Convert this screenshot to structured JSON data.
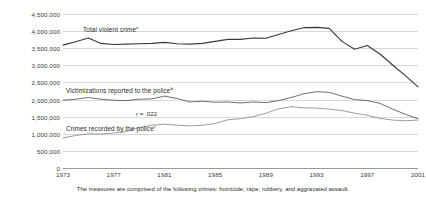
{
  "chart_data": {
    "type": "line",
    "title": "",
    "xlabel": "",
    "ylabel": "",
    "xlim": [
      1973,
      2001
    ],
    "ylim": [
      0,
      4500000
    ],
    "grid": true,
    "legend": "inline-labels",
    "y_ticks": [
      "0",
      "500,000",
      "1,000,000",
      "1,500,000",
      "2,000,000",
      "2,500,000",
      "3,000,000",
      "3,500,000",
      "4,000,000",
      "4,500,000"
    ],
    "y_tick_values": [
      0,
      500000,
      1000000,
      1500000,
      2000000,
      2500000,
      3000000,
      3500000,
      4000000,
      4500000
    ],
    "x_ticks": [
      "1973",
      "1977",
      "1981",
      "1985",
      "1989",
      "1993",
      "1997",
      "2001"
    ],
    "x_tick_values": [
      1973,
      1977,
      1981,
      1985,
      1989,
      1993,
      1997,
      2001
    ],
    "x": [
      1973,
      1974,
      1975,
      1976,
      1977,
      1978,
      1979,
      1980,
      1981,
      1982,
      1983,
      1984,
      1985,
      1986,
      1987,
      1988,
      1989,
      1990,
      1991,
      1992,
      1993,
      1994,
      1995,
      1996,
      1997,
      1998,
      1999,
      2000,
      2001
    ],
    "series": [
      {
        "name": "Total violent crime",
        "footnote_marker": "a",
        "color": "#3a3a3a",
        "values": [
          3590000,
          3690000,
          3800000,
          3640000,
          3610000,
          3620000,
          3630000,
          3640000,
          3670000,
          3630000,
          3620000,
          3640000,
          3700000,
          3760000,
          3760000,
          3800000,
          3790000,
          3900000,
          4010000,
          4100000,
          4110000,
          4080000,
          3700000,
          3470000,
          3580000,
          3330000,
          3010000,
          2700000,
          2370000
        ]
      },
      {
        "name": "Victimizations reported to the police",
        "footnote_marker": "b",
        "color": "#555555",
        "values": [
          1980000,
          2010000,
          2060000,
          2010000,
          1980000,
          1970000,
          2010000,
          2020000,
          2100000,
          2030000,
          1930000,
          1950000,
          1920000,
          1930000,
          1900000,
          1930000,
          1910000,
          1970000,
          2060000,
          2170000,
          2230000,
          2210000,
          2100000,
          2000000,
          1970000,
          1890000,
          1720000,
          1570000,
          1440000
        ]
      },
      {
        "name": "Crimes recorded by the police",
        "footnote_marker": "c",
        "color": "#8a8a8a",
        "values": [
          880000,
          950000,
          1000000,
          990000,
          1020000,
          1070000,
          1180000,
          1250000,
          1280000,
          1250000,
          1230000,
          1250000,
          1300000,
          1410000,
          1440000,
          1500000,
          1600000,
          1730000,
          1790000,
          1760000,
          1750000,
          1720000,
          1680000,
          1600000,
          1540000,
          1450000,
          1400000,
          1380000,
          1400000
        ]
      }
    ],
    "annotations": [
      {
        "id": "correlation",
        "symbol": "r",
        "text": " = .022"
      }
    ],
    "footnote": "The measures are comprised of the following crimes: homicide, rape, robbery, and aggravated assault."
  },
  "labels": {
    "total_violent_crime": "Total violent crime",
    "victimizations_reported": "Victimizations reported to the police",
    "crimes_recorded": "Crimes recorded by the police"
  }
}
